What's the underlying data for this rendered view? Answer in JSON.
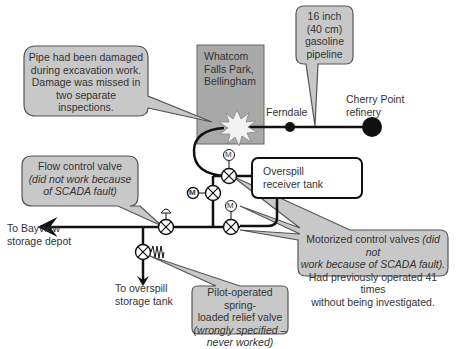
{
  "colors": {
    "callout_fill": "#c8c8c8",
    "callout_stroke": "#555555",
    "site_box_fill": "#a9a9a9",
    "pipe": "#111111",
    "burst_fill": "#f2f2f2",
    "text": "#333333"
  },
  "site_box": {
    "lines": [
      "Whatcom",
      "Falls Park,",
      "Bellingham"
    ]
  },
  "labels": {
    "ferndale": "Ferndale",
    "cherry_point": [
      "Cherry Point",
      "refinery"
    ],
    "bayview": [
      "To Bayview",
      "storage depot"
    ],
    "overspill_tank_dest": [
      "To overspill",
      "storage tank"
    ],
    "overspill_receiver": [
      "Overspill",
      "receiver tank"
    ]
  },
  "callouts": {
    "damage": {
      "lines": [
        "Pipe had been damaged",
        "during excavation work.",
        "Damage was missed in",
        "two separate",
        "inspections."
      ]
    },
    "pipeline": {
      "lines": [
        "16 inch",
        "(40 cm)",
        "gasoline",
        "pipeline"
      ]
    },
    "flow_control": {
      "title": "Flow control valve",
      "italic_lines": [
        "(did not work because",
        "of SCADA fault)"
      ]
    },
    "motorized": {
      "line1_normal": "Motorized control valves ",
      "line1_italic": "(did not",
      "line2_italic": "work because of SCADA fault).",
      "line3": "Had previously operated 41 times",
      "line4": "without being investigated."
    },
    "relief": {
      "lines_normal": [
        "Pilot-operated spring-",
        "loaded relief valve"
      ],
      "italic_lines": [
        "(wrongly specified –",
        "never worked)"
      ]
    }
  },
  "valve_symbols": {
    "motor_letter": "M"
  }
}
